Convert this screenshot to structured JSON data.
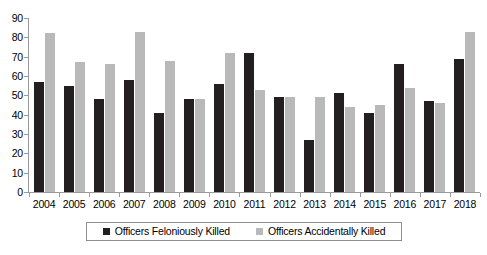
{
  "chart_data": {
    "type": "bar",
    "title": "",
    "subtitle": "",
    "xlabel": "",
    "ylabel": "",
    "ylim": [
      0,
      90
    ],
    "ytick_step": 10,
    "yticks": [
      "90",
      "80",
      "70",
      "60",
      "50",
      "40",
      "30",
      "20",
      "10",
      "0"
    ],
    "grid": false,
    "legend_position": "bottom",
    "categories": [
      "2004",
      "2005",
      "2006",
      "2007",
      "2008",
      "2009",
      "2010",
      "2011",
      "2012",
      "2013",
      "2014",
      "2015",
      "2016",
      "2017",
      "2018"
    ],
    "series": [
      {
        "name": "Officers Feloniously Killed",
        "color": "#231f20",
        "values": [
          57,
          55,
          48,
          58,
          41,
          48,
          56,
          72,
          49,
          27,
          51,
          41,
          66,
          47,
          69
        ]
      },
      {
        "name": "Officers Accidentally Killed",
        "color": "#b9b9b9",
        "values": [
          82,
          67,
          66,
          83,
          68,
          48,
          72,
          53,
          49,
          49,
          44,
          45,
          54,
          46,
          83
        ]
      }
    ]
  },
  "legend": {
    "items": [
      {
        "label": "Officers Feloniously Killed",
        "swatch": "felony"
      },
      {
        "label": "Officers Accidentally Killed",
        "swatch": "accident"
      }
    ]
  }
}
